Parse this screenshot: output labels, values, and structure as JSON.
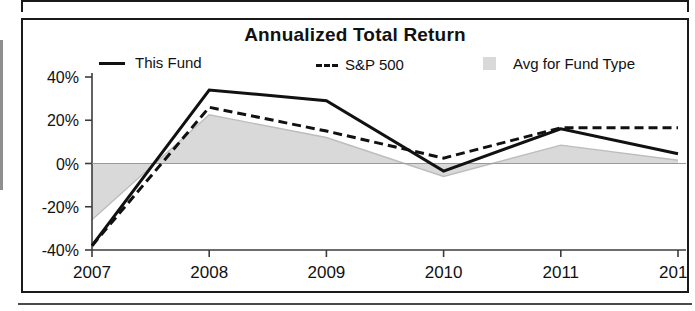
{
  "chart_data": {
    "type": "line",
    "title": "Annualized Total Return",
    "xlabel": "",
    "ylabel": "",
    "x": [
      "2007",
      "2008",
      "2009",
      "2010",
      "2011",
      "2012"
    ],
    "x_suffix_label": "YTD",
    "categories": [
      "2007",
      "2008",
      "2009",
      "2010",
      "2011",
      "2012"
    ],
    "ylim": [
      -40,
      40
    ],
    "ytick_labels": [
      "40%",
      "20%",
      "0%",
      "-20%",
      "-40%"
    ],
    "ytick_values": [
      40,
      20,
      0,
      -20,
      -40
    ],
    "grid": false,
    "legend_position": "top",
    "series": [
      {
        "name": "This Fund",
        "style": "solid-line",
        "color": "#111111",
        "values": [
          -38,
          34,
          29,
          -3.5,
          16,
          4.5
        ]
      },
      {
        "name": "S&P 500",
        "style": "dashed-line",
        "color": "#111111",
        "values": [
          -38,
          26,
          15,
          2.5,
          16.5,
          16.5
        ]
      },
      {
        "name": "Avg for Fund Type",
        "style": "filled-area",
        "color": "#d9d9d9",
        "values": [
          -26,
          22.5,
          12,
          -6,
          8.5,
          1.5
        ]
      }
    ]
  },
  "chart": {
    "title": "Annualized Total Return",
    "legend": [
      {
        "label": "This Fund",
        "marker": "solid-line-swatch"
      },
      {
        "label": "S&P 500",
        "marker": "dashed-line-swatch"
      },
      {
        "label": "Avg for Fund Type",
        "marker": "gray-square-swatch"
      }
    ],
    "y_axis": {
      "ticks": [
        "40%",
        "20%",
        "0%",
        "-20%",
        "-40%"
      ]
    },
    "x_axis": {
      "ticks": [
        "2007",
        "2008",
        "2009",
        "2010",
        "2011",
        "2012"
      ],
      "suffix": "YTD"
    }
  },
  "colors": {
    "line": "#111111",
    "area": "#d9d9d9",
    "axis": "#3c3c3c",
    "border": "#1a1a1a",
    "background": "#ffffff"
  }
}
